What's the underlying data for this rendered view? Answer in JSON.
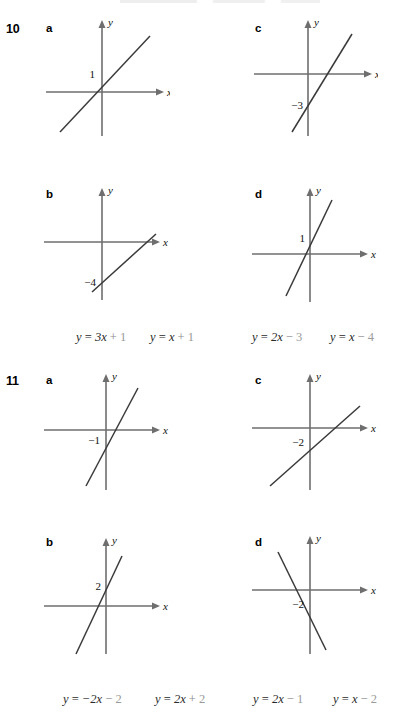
{
  "document": {
    "type": "math-textbook-exercise-page",
    "questions": [
      {
        "number": "10",
        "parts": [
          {
            "letter": "a",
            "graph": {
              "x_axis_label": "x",
              "y_axis_label": "y",
              "intercept_label": "1",
              "intercept_value": 1,
              "slope": 1,
              "description": "line with positive slope crossing y-axis at 1"
            }
          },
          {
            "letter": "c",
            "graph": {
              "x_axis_label": "x",
              "y_axis_label": "y",
              "intercept_label": "−3",
              "intercept_value": -3,
              "slope": 2,
              "description": "steep line with positive slope crossing y-axis at -3"
            }
          },
          {
            "letter": "b",
            "graph": {
              "x_axis_label": "x",
              "y_axis_label": "y",
              "intercept_label": "−4",
              "intercept_value": -4,
              "slope": 1,
              "description": "shallow line with positive slope crossing y-axis at -4"
            }
          },
          {
            "letter": "d",
            "graph": {
              "x_axis_label": "x",
              "y_axis_label": "y",
              "intercept_label": "1",
              "intercept_value": 1,
              "slope": 3,
              "description": "steep line with positive slope crossing y-axis at 1"
            }
          }
        ],
        "equations": [
          {
            "lhs": "y",
            "eq": "=",
            "term": "3x",
            "op": "+",
            "constant": "1",
            "text": "y = 3x + 1"
          },
          {
            "lhs": "y",
            "eq": "=",
            "term": "x",
            "op": "+",
            "constant": "1",
            "text": "y = x + 1"
          },
          {
            "lhs": "y",
            "eq": "=",
            "term": "2x",
            "op": "−",
            "constant": "3",
            "text": "y = 2x − 3"
          },
          {
            "lhs": "y",
            "eq": "=",
            "term": "x",
            "op": "−",
            "constant": "4",
            "text": "y = x − 4"
          }
        ]
      },
      {
        "number": "11",
        "parts": [
          {
            "letter": "a",
            "graph": {
              "x_axis_label": "x",
              "y_axis_label": "y",
              "intercept_label": "−1",
              "intercept_value": -1,
              "slope": 2,
              "description": "line with positive slope crossing y-axis at -1"
            }
          },
          {
            "letter": "c",
            "graph": {
              "x_axis_label": "x",
              "y_axis_label": "y",
              "intercept_label": "−2",
              "intercept_value": -2,
              "slope": 1,
              "description": "shallow line with positive slope crossing y-axis at -2"
            }
          },
          {
            "letter": "b",
            "graph": {
              "x_axis_label": "x",
              "y_axis_label": "y",
              "intercept_label": "2",
              "intercept_value": 2,
              "slope": 2,
              "description": "line with positive slope crossing y-axis at 2"
            }
          },
          {
            "letter": "d",
            "graph": {
              "x_axis_label": "x",
              "y_axis_label": "y",
              "intercept_label": "−2",
              "intercept_value": -2,
              "slope": -2,
              "description": "line with negative slope crossing y-axis at -2"
            }
          }
        ],
        "equations": [
          {
            "lhs": "y",
            "eq": "=",
            "term": "−2x",
            "op": "−",
            "constant": "2",
            "text": "y = −2x − 2"
          },
          {
            "lhs": "y",
            "eq": "=",
            "term": "2x",
            "op": "+",
            "constant": "2",
            "text": "y = 2x + 2"
          },
          {
            "lhs": "y",
            "eq": "=",
            "term": "2x",
            "op": "−",
            "constant": "1",
            "text": "y = 2x − 1"
          },
          {
            "lhs": "y",
            "eq": "=",
            "term": "x",
            "op": "−",
            "constant": "2",
            "text": "y = x − 2"
          }
        ]
      }
    ],
    "colors": {
      "axis": "#6e6e6e",
      "line": "#3a3a3a",
      "text": "#1a1a1a",
      "equation_faint": "#9a9a9a",
      "background": "#ffffff"
    }
  }
}
